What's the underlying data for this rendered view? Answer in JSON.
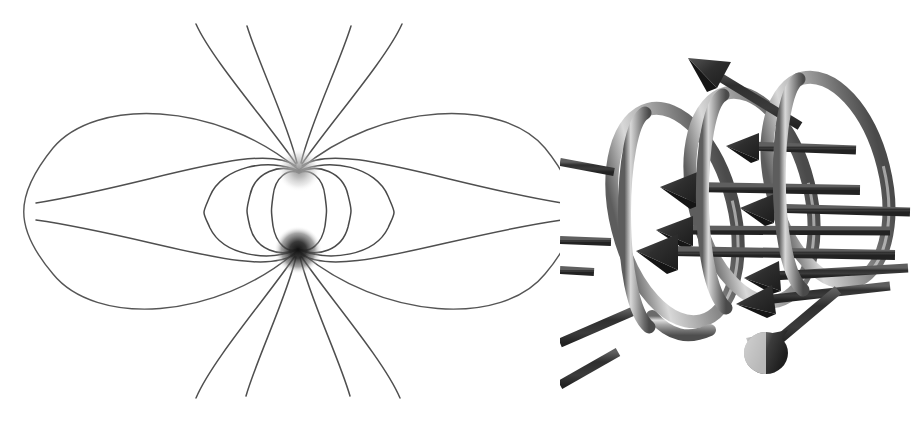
{
  "figure": {
    "width": 913,
    "height": 423,
    "background_color": "#ffffff",
    "caption": "",
    "panel_count": 2
  },
  "panels": [
    {
      "id": "dipole",
      "name": "magnetic-dipole-field",
      "title": "",
      "description": "Magnetic dipole field lines between two poles",
      "poles": [
        {
          "label": "",
          "role": "north-pole",
          "shade": "light",
          "color": "#9a9a9a",
          "cx": 299,
          "cy": 170,
          "radius": 13
        },
        {
          "label": "",
          "role": "south-pole",
          "shade": "dark",
          "color": "#2b2b2b",
          "cx": 298,
          "cy": 250,
          "radius": 15
        }
      ],
      "loop_count_per_side": 4,
      "loop_extents_x": [
        41,
        210,
        253,
        275,
        320,
        340,
        395,
        560
      ],
      "radial_line_count": 12,
      "line_color": "#4a4a4a"
    },
    {
      "id": "solenoid",
      "name": "solenoid-coil-with-field-arrows",
      "title": "",
      "description": "Tilted helical coil with field arrows pointing out to the upper left",
      "coil_turns": 3,
      "coil_color_light": "#d2d2d2",
      "coil_color_mid": "#8f8f8f",
      "coil_color_dark": "#5a5a5a",
      "arrow_count": 11,
      "arrow_color": "#3b3b3b",
      "arrow_direction": "upper-left"
    }
  ],
  "colors": {
    "background": "#ffffff",
    "field_line": "#4a4a4a",
    "arrow": "#3b3b3b",
    "pole_north": "#9a9a9a",
    "pole_south": "#2b2b2b",
    "coil_highlight": "#e0e0e0",
    "coil_shadow": "#4e4e4e"
  },
  "chart_data": {
    "type": "diagram",
    "title": "",
    "subtitle": "",
    "xlabel": "",
    "ylabel": "",
    "legend": [],
    "annotations": [],
    "series": [
      {
        "name": "dipole-field-loops",
        "values": [
          41,
          210,
          253,
          275,
          320,
          340,
          395,
          560
        ]
      },
      {
        "name": "solenoid-turns",
        "values": [
          1,
          2,
          3
        ]
      }
    ]
  }
}
